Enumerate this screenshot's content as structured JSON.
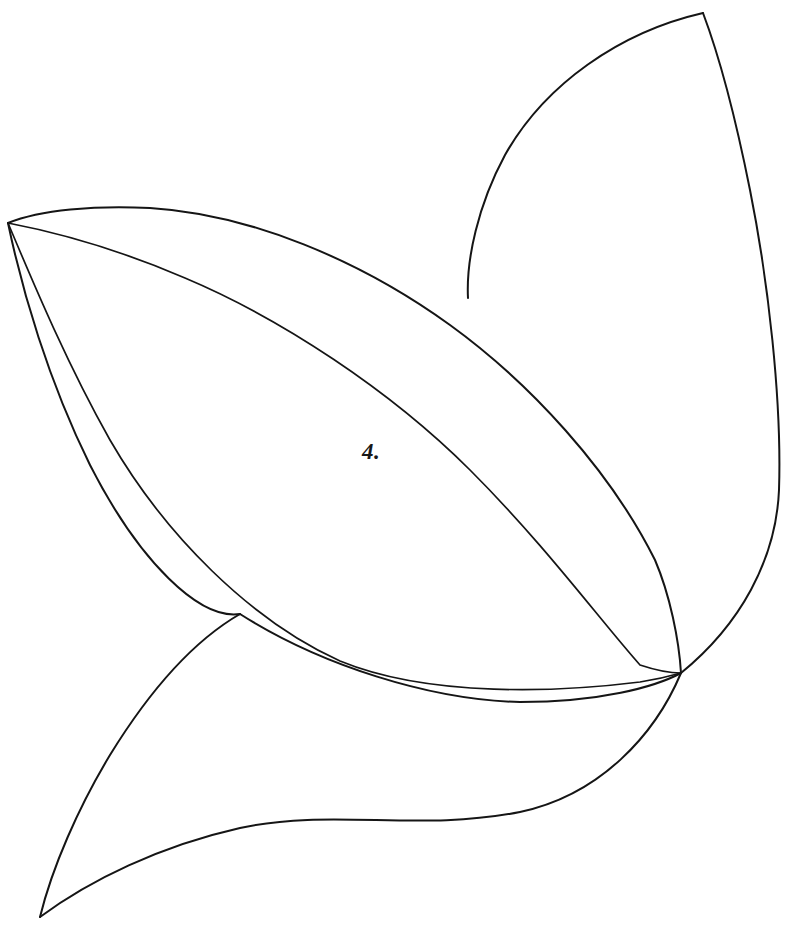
{
  "figure": {
    "label": "4.",
    "background_color": "#ffffff",
    "ink_color": "#151515",
    "canvas": {
      "width": 798,
      "height": 937
    },
    "label_position": {
      "x": 362,
      "y": 440
    },
    "nodes": {
      "left_apex": {
        "x": 8,
        "y": 223
      },
      "right_node": {
        "x": 681,
        "y": 673
      },
      "upper_petal_tip": {
        "x": 703,
        "y": 13
      },
      "lower_petal_tip": {
        "x": 40,
        "y": 917
      },
      "upper_petal_base_junction": {
        "x": 468,
        "y": 298
      },
      "lower_petal_base_junction": {
        "x": 240,
        "y": 614
      }
    },
    "strokes": [
      {
        "name": "leaf-outer-upper-edge",
        "description": "Outer top contour of the central almond leaf, from left apex to right node",
        "path": "M 8 223 C 40 210 95 205 150 208 C 250 214 360 260 450 325 C 530 383 610 470 655 560 C 670 595 679 640 681 673"
      },
      {
        "name": "leaf-inner-upper-edge",
        "description": "Inner top contour of the central almond leaf, parallel and offset inward",
        "path": "M 8 223 C 55 232 120 250 185 278 C 280 318 390 390 470 470 C 545 545 600 620 640 665 C 655 670 672 673 681 673"
      },
      {
        "name": "leaf-inner-lower-edge",
        "description": "Inner bottom contour of the central almond leaf",
        "path": "M 8 223 C 30 275 65 360 110 440 C 165 535 250 620 340 661 C 430 698 560 692 640 682 C 660 679 674 675 681 673"
      },
      {
        "name": "leaf-outer-lower-edge",
        "description": "Outer bottom contour of the central almond leaf",
        "path": "M 8 223 C 22 290 48 380 90 465 C 140 563 200 620 240 614 C 320 665 430 700 520 702 C 600 702 655 687 681 673"
      },
      {
        "name": "upper-petal-outer-edge",
        "description": "Outer (left/upper) crescent edge of the top petal, rising to the tip",
        "path": "M 468 298 C 466 260 478 205 505 155 C 545 84 620 32 703 13"
      },
      {
        "name": "upper-petal-inner-edge",
        "description": "Inner (right) crescent edge of the top petal, sweeping down to the right node",
        "path": "M 703 13 C 720 58 736 120 750 190 C 768 280 782 400 779 490 C 776 560 740 625 681 673"
      },
      {
        "name": "lower-petal-upper-edge",
        "description": "Upper crescent edge of the bottom-left petal, from leaf underside to the tip",
        "path": "M 240 614 C 195 640 150 690 110 755 C 78 808 52 868 40 917"
      },
      {
        "name": "lower-petal-lower-edge",
        "description": "Lower crescent edge of the bottom-left petal, sweeping right to the node",
        "path": "M 40 917 C 90 880 160 846 240 828 C 330 808 420 832 520 812 C 600 795 655 735 681 673"
      }
    ]
  }
}
